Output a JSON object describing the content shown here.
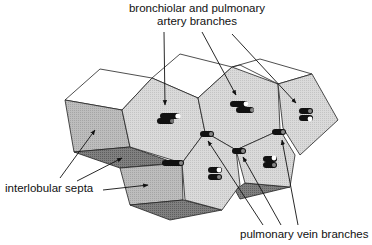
{
  "diagram": {
    "labels": {
      "top_line1": "bronchiolar and pulmonary",
      "top_line2": "artery branches",
      "left": "interlobular septa",
      "bottom": "pulmonary vein branches"
    },
    "colors": {
      "lobule_face": "#d9d9d9",
      "top_face": "#ffffff",
      "side_face": "#b9b9b9",
      "dark_face": "#7d7d7d",
      "stroke": "#222222",
      "vessel": "#111111"
    }
  }
}
